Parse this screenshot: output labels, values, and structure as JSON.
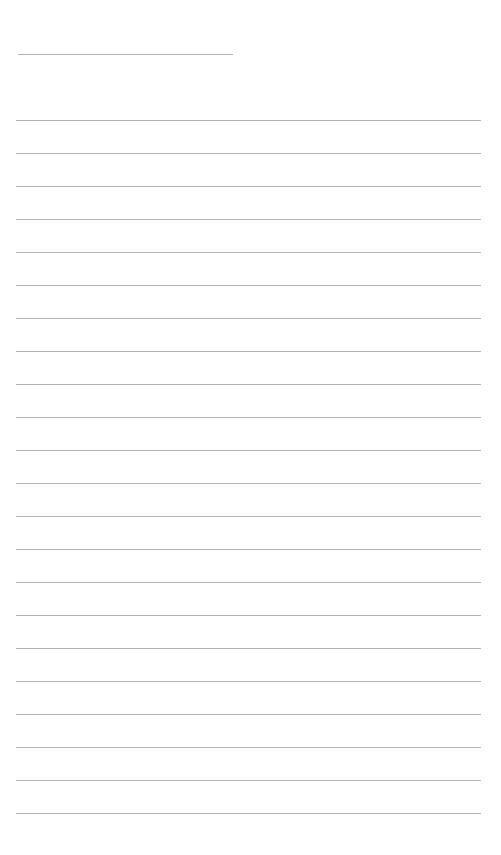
{
  "page": {
    "type": "lined-paper",
    "background_color": "#ffffff",
    "line_color": "#b4b4b4",
    "header_line": {
      "x_start": 18,
      "x_end": 233,
      "y": 54
    },
    "body_lines": {
      "count": 22,
      "x_start": 16,
      "x_end": 481,
      "first_y": 120,
      "spacing": 33
    },
    "text_content": []
  }
}
